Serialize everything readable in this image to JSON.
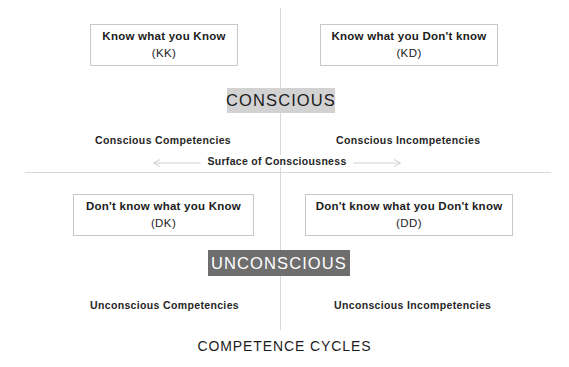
{
  "diagram": {
    "title": "COMPETENCE CYCLES",
    "axes": {
      "vertical_name": "vertical-divider",
      "horizontal_name": "horizontal-divider"
    },
    "surface": {
      "label": "Surface of Consciousness",
      "arrow": "double-headed-horizontal-arrow"
    },
    "badges": {
      "conscious": {
        "label": "CONSCIOUS",
        "background": "#d2d2d2",
        "text_color": "#1c1c1c"
      },
      "unconscious": {
        "label": "UNCONSCIOUS",
        "background": "#6e6e6e",
        "text_color": "#ffffff"
      }
    },
    "boxes": [
      {
        "id": "KK",
        "text": "Know what you Know",
        "code": "(KK)"
      },
      {
        "id": "KD",
        "text": "Know what you Don't know",
        "code": "(KD)"
      },
      {
        "id": "DK",
        "text": "Don't know what you Know",
        "code": "(DK)"
      },
      {
        "id": "DD",
        "text": "Don't know what you Don't know",
        "code": "(DD)"
      }
    ],
    "quadrant_captions": {
      "top_left": "Conscious Competencies",
      "top_right": "Conscious Incompetencies",
      "bottom_left": "Unconscious Competencies",
      "bottom_right": "Unconscious Incompetencies"
    },
    "colors": {
      "background": "#ffffff",
      "axis_line": "#d8d8d8",
      "box_border": "#c8c8c8",
      "text": "#1c1c1c"
    }
  }
}
